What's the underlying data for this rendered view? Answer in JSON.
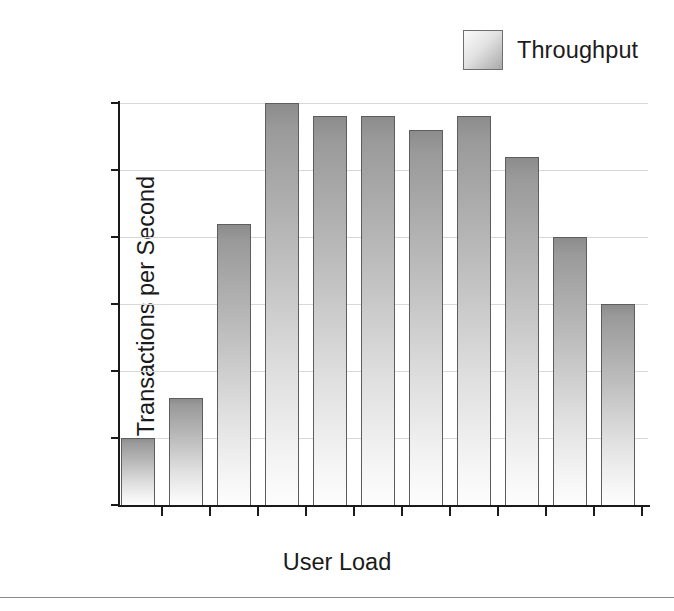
{
  "figure": {
    "background_color": "#ffffff",
    "bottom_rule_color": "#8a8a8a"
  },
  "legend": {
    "position": "top-right",
    "swatch_name": "throughput-swatch",
    "entries": [
      {
        "label": "Throughput",
        "color": "#a9a9a9"
      }
    ]
  },
  "axes": {
    "y_title": "Transactions per Second",
    "x_title": "User Load",
    "y_ticks": [
      "0",
      "5",
      "10",
      "15",
      "20",
      "25",
      "30"
    ],
    "x_tick_labels": [
      "1",
      "",
      "5",
      "",
      "15",
      "",
      "40",
      "",
      "160",
      "",
      "640"
    ]
  },
  "chart_data": {
    "type": "bar",
    "title": "",
    "xlabel": "User Load",
    "ylabel": "Transactions per Second",
    "categories": [
      "1",
      "2",
      "5",
      "10",
      "15",
      "25",
      "40",
      "80",
      "160",
      "320",
      "640"
    ],
    "category_tick_labels": [
      "1",
      "",
      "5",
      "",
      "15",
      "",
      "40",
      "",
      "160",
      "",
      "640"
    ],
    "values": [
      5,
      8,
      21,
      30,
      29,
      29,
      28,
      29,
      26,
      20,
      15
    ],
    "series": [
      {
        "name": "Throughput",
        "values": [
          5,
          8,
          21,
          30,
          29,
          29,
          28,
          29,
          26,
          20,
          15
        ]
      }
    ],
    "ylim": [
      0,
      30
    ],
    "ytick_values": [
      0,
      5,
      10,
      15,
      20,
      25,
      30
    ],
    "grid": true,
    "grid_axis": "y",
    "grid_color": "#d8d8d8",
    "legend_position": "top-right",
    "bar_edge_color": "#5d5d5d",
    "bar_fill_top_color": "#8c8c8c",
    "bar_fill_bottom_color": "#fdfdfd"
  }
}
